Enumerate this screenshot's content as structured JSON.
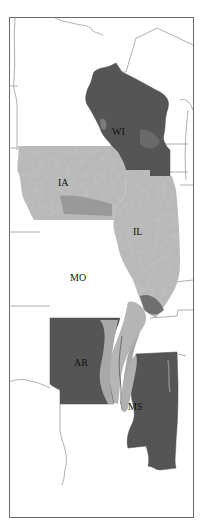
{
  "map": {
    "type": "state-outline map (grayscale raster overlay)",
    "colors": {
      "background": "#ffffff",
      "frame": "#6a6a6a",
      "border_lines": "#9a9a9a",
      "dark_fill": "#555555",
      "light_fill": "#b8b8b8",
      "mid_fill": "#8a8a8a",
      "label": "#111111"
    },
    "states": [
      {
        "id": "WI",
        "label": "WI",
        "shading": "dark"
      },
      {
        "id": "IA",
        "label": "IA",
        "shading": "light-mottled"
      },
      {
        "id": "IL",
        "label": "IL",
        "shading": "light-mottled"
      },
      {
        "id": "MO",
        "label": "MO",
        "shading": "none"
      },
      {
        "id": "AR",
        "label": "AR",
        "shading": "dark"
      },
      {
        "id": "MS",
        "label": "MS",
        "shading": "dark"
      }
    ]
  }
}
